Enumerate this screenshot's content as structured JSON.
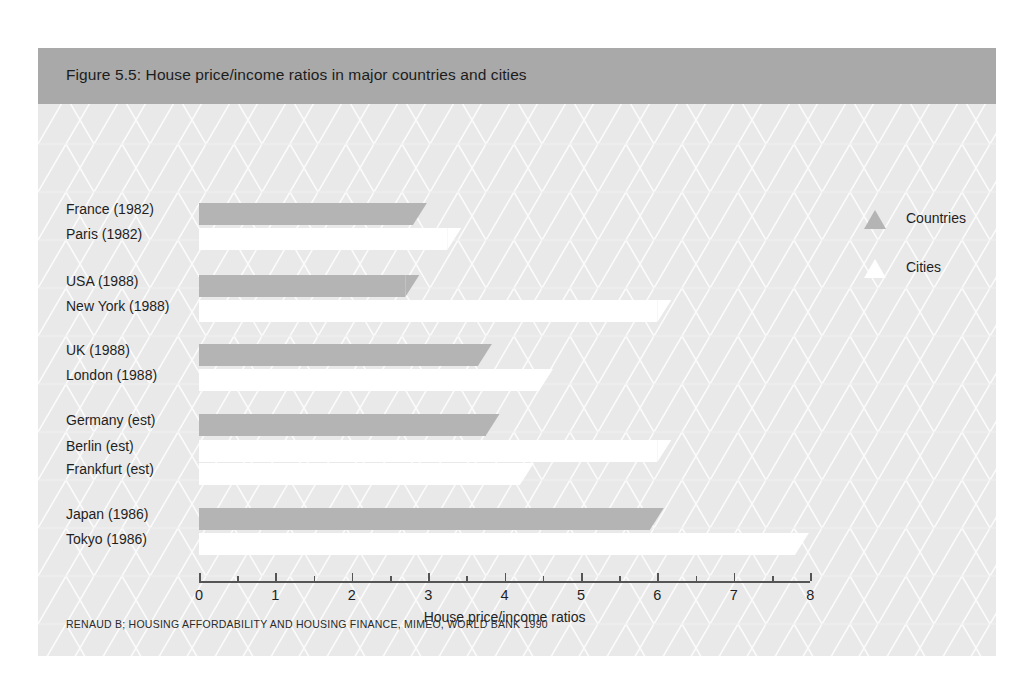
{
  "figure": {
    "title": "Figure 5.5: House price/income ratios in major countries and cities",
    "source_note": "RENAUD B; HOUSING AFFORDABILITY AND HOUSING FINANCE, MIMEO, WORLD BANK 1990"
  },
  "legend": {
    "position": "top-right",
    "entries": [
      {
        "label": "Countries",
        "marker": "triangle-up-icon",
        "color": "#b4b4b4"
      },
      {
        "label": "Cities",
        "marker": "triangle-up-icon",
        "color": "#ffffff"
      }
    ]
  },
  "colors": {
    "banner": "#a9a9a9",
    "body": "#e9e9e9",
    "country_bar": "#b4b4b4",
    "city_bar": "#ffffff",
    "axis": "#555555",
    "text": "#1f1f1f"
  },
  "chart_data": {
    "type": "bar",
    "orientation": "horizontal",
    "title": "Figure 5.5: House price/income ratios in major countries and cities",
    "xlabel": "House price/income ratios",
    "ylabel": "",
    "xlim": [
      0,
      8
    ],
    "xticks": [
      0,
      1,
      2,
      3,
      4,
      5,
      6,
      7,
      8
    ],
    "xticklabels": [
      "0",
      "1",
      "2",
      "3",
      "4",
      "5",
      "6",
      "7",
      "8"
    ],
    "minor_ticks": [
      0.5,
      1.5,
      2.5,
      3.5,
      4.5,
      5.5,
      6.5,
      7.5
    ],
    "grid": false,
    "legend": [
      "Countries",
      "Cities"
    ],
    "groups": [
      {
        "name": "France",
        "bars": [
          {
            "label": "France (1982)",
            "value": 2.8,
            "series": "Countries"
          },
          {
            "label": "Paris (1982)",
            "value": 3.25,
            "series": "Cities"
          }
        ]
      },
      {
        "name": "USA",
        "bars": [
          {
            "label": "USA (1988)",
            "value": 2.7,
            "series": "Countries"
          },
          {
            "label": "New York (1988)",
            "value": 6.0,
            "series": "Cities"
          }
        ]
      },
      {
        "name": "UK",
        "bars": [
          {
            "label": "UK (1988)",
            "value": 3.65,
            "series": "Countries"
          },
          {
            "label": "London (1988)",
            "value": 4.45,
            "series": "Cities"
          }
        ]
      },
      {
        "name": "Germany",
        "bars": [
          {
            "label": "Germany (est)",
            "value": 3.75,
            "series": "Countries"
          },
          {
            "label": "Berlin (est)",
            "value": 6.0,
            "series": "Cities"
          },
          {
            "label": "Frankfurt (est)",
            "value": 4.2,
            "series": "Cities"
          }
        ]
      },
      {
        "name": "Japan",
        "bars": [
          {
            "label": "Japan (1986)",
            "value": 5.9,
            "series": "Countries"
          },
          {
            "label": "Tokyo (1986)",
            "value": 7.8,
            "series": "Cities"
          }
        ]
      }
    ],
    "categories": [
      "France (1982)",
      "Paris (1982)",
      "USA (1988)",
      "New York (1988)",
      "UK (1988)",
      "London (1988)",
      "Germany (est)",
      "Berlin (est)",
      "Frankfurt (est)",
      "Japan (1986)",
      "Tokyo (1986)"
    ],
    "values": [
      2.8,
      3.25,
      2.7,
      6.0,
      3.65,
      4.45,
      3.75,
      6.0,
      4.2,
      5.9,
      7.8
    ]
  },
  "layout": {
    "rows": [
      {
        "key": "France (1982)",
        "y": 99,
        "series": "Countries"
      },
      {
        "key": "Paris (1982)",
        "y": 124,
        "series": "Cities"
      },
      {
        "key": "USA (1988)",
        "y": 171,
        "series": "Countries"
      },
      {
        "key": "New York (1988)",
        "y": 196,
        "series": "Cities"
      },
      {
        "key": "UK (1988)",
        "y": 240,
        "series": "Countries"
      },
      {
        "key": "London (1988)",
        "y": 265,
        "series": "Cities"
      },
      {
        "key": "Germany (est)",
        "y": 310,
        "series": "Countries"
      },
      {
        "key": "Berlin (est)",
        "y": 336,
        "series": "Cities"
      },
      {
        "key": "Frankfurt (est)",
        "y": 359,
        "series": "Cities"
      },
      {
        "key": "Japan (1986)",
        "y": 404,
        "series": "Countries"
      },
      {
        "key": "Tokyo (1986)",
        "y": 429,
        "series": "Cities"
      }
    ],
    "axis_x0": 161,
    "axis_px_per_unit": 76.4,
    "axis_y": 477,
    "axis_title_y": 505,
    "legend_x": 826,
    "legend_rows_y": [
      103,
      152
    ]
  }
}
